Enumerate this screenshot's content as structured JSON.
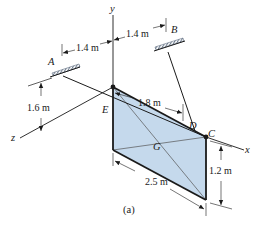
{
  "figure": {
    "caption": "(a)",
    "axes": {
      "x": "x",
      "y": "y",
      "z": "z"
    },
    "points": {
      "A": "A",
      "B": "B",
      "C": "C",
      "D": "D",
      "E": "E",
      "G": "G"
    },
    "dimensions": {
      "a_offset": "1.4 m",
      "b_offset": "1.4 m",
      "height_a": "1.6 m",
      "ed_length": "1.8 m",
      "plate_length": "2.5 m",
      "plate_height": "1.2 m"
    },
    "colors": {
      "plate_fill": "#c5d9ec",
      "line": "#1a1a1a",
      "support_hatch": "#5a6a80"
    }
  }
}
